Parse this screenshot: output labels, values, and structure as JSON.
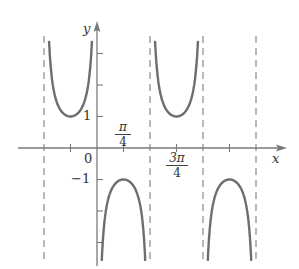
{
  "chart_data": {
    "type": "line",
    "title": "",
    "function_hint": "y = -csc(2x)",
    "xlabel": "x",
    "ylabel": "y",
    "x_tick_labels": [
      {
        "x": 0,
        "label": "0"
      },
      {
        "x": 0.7854,
        "label": "π/4"
      },
      {
        "x": 2.3562,
        "label": "3π/4"
      }
    ],
    "x_ticks": [
      -0.7854,
      0.7854,
      2.3562,
      3.927
    ],
    "y_tick_labels": [
      {
        "y": 1,
        "label": "1"
      },
      {
        "y": -1,
        "label": "-1"
      }
    ],
    "y_ticks": [
      3,
      2,
      1,
      -1,
      -2,
      -3
    ],
    "asymptotes_x": [
      -1.5708,
      0,
      1.5708,
      3.1416,
      4.7124
    ],
    "branches": [
      {
        "x_range": [
          -1.5708,
          0
        ],
        "sign": "positive",
        "vertex": {
          "x": -0.7854,
          "y": 1
        }
      },
      {
        "x_range": [
          0,
          1.5708
        ],
        "sign": "negative",
        "vertex": {
          "x": 0.7854,
          "y": -1
        }
      },
      {
        "x_range": [
          1.5708,
          3.1416
        ],
        "sign": "positive",
        "vertex": {
          "x": 2.3562,
          "y": 1
        }
      },
      {
        "x_range": [
          3.1416,
          4.7124
        ],
        "sign": "negative",
        "vertex": {
          "x": 3.927,
          "y": -1
        }
      }
    ],
    "xlim": [
      -1.9,
      5.1
    ],
    "ylim": [
      -4,
      4
    ],
    "grid": false,
    "legend": null
  },
  "labels": {
    "y_axis": "y",
    "x_axis": "x",
    "origin": "0",
    "y_one": "1",
    "y_neg_one": "−1",
    "pi_over_4_num": "π",
    "pi_over_4_den": "4",
    "three_pi_over_4_num": "3π",
    "three_pi_over_4_den": "4"
  },
  "colors": {
    "curve": "#6e6e6e",
    "axis": "#7a7a7a",
    "asymptote": "#8a8a8a"
  }
}
